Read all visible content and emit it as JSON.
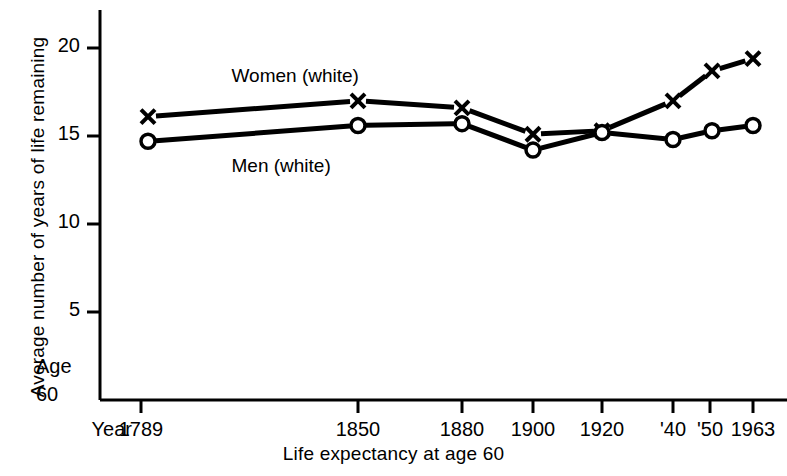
{
  "chart_data": {
    "type": "line",
    "title": "",
    "xlabel": "Life expectancy at age 60",
    "ylabel": "Average number of years of life remaining",
    "x_prefix_label": "Year",
    "y_origin_labels": [
      "Age",
      "60"
    ],
    "categories": [
      "1789",
      "1850",
      "1880",
      "1900",
      "1920",
      "'40",
      "'50",
      "1963"
    ],
    "x_positions": [
      1789,
      1850,
      1880,
      1900,
      1920,
      1940,
      1950,
      1963
    ],
    "ylim": [
      0,
      22
    ],
    "yticks": [
      5,
      10,
      15,
      20
    ],
    "ytick_labels": [
      "5",
      "10",
      "15",
      "20"
    ],
    "grid": false,
    "legend_position": "inline-annotations",
    "series": [
      {
        "name": "Women (white)",
        "marker": "x",
        "values": [
          16.1,
          17.0,
          16.6,
          15.1,
          15.3,
          17.0,
          18.7,
          19.4
        ]
      },
      {
        "name": "Men (white)",
        "marker": "o",
        "values": [
          14.7,
          15.6,
          15.7,
          14.2,
          15.2,
          14.8,
          15.3,
          15.6
        ]
      }
    ],
    "annotations": [
      {
        "text": "Women (white)",
        "x": 1815,
        "y": 18.3
      },
      {
        "text": "Men (white)",
        "x": 1815,
        "y": 13.2
      }
    ]
  },
  "axis": {
    "line_color": "#000000",
    "tick_length": 12
  }
}
